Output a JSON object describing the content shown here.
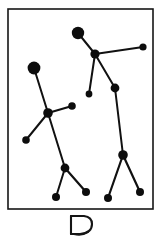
{
  "figure": {
    "kind": "constellation-star-chart",
    "panel_label": "B",
    "title": "",
    "background_color": "#ffffff",
    "ink_color": "#0d0d0d",
    "frame": {
      "x": 8,
      "y": 9,
      "width": 145,
      "height": 200,
      "stroke_color": "#161616",
      "stroke_width": 1.6
    },
    "caption": "B"
  },
  "chart_data": {
    "type": "scatter",
    "title": "",
    "subtitle": "",
    "xlabel": "",
    "ylabel": "",
    "xlim": [
      8,
      153
    ],
    "ylim": [
      9,
      209
    ],
    "grid": false,
    "legend": "none",
    "annotations": [
      "B"
    ],
    "stars": [
      {
        "id": "s1",
        "x": 78,
        "y": 33,
        "r": 6.2,
        "magnitude": "bright"
      },
      {
        "id": "s2",
        "x": 95,
        "y": 54,
        "r": 4.6,
        "magnitude": "medium"
      },
      {
        "id": "s3",
        "x": 143,
        "y": 47,
        "r": 3.6,
        "magnitude": "faint"
      },
      {
        "id": "s4",
        "x": 34,
        "y": 68,
        "r": 6.4,
        "magnitude": "bright"
      },
      {
        "id": "s5",
        "x": 89,
        "y": 94,
        "r": 3.4,
        "magnitude": "faint"
      },
      {
        "id": "s6",
        "x": 115,
        "y": 88,
        "r": 4.4,
        "magnitude": "medium"
      },
      {
        "id": "s7",
        "x": 72,
        "y": 106,
        "r": 3.8,
        "magnitude": "faint"
      },
      {
        "id": "s8",
        "x": 48,
        "y": 113,
        "r": 4.8,
        "magnitude": "medium"
      },
      {
        "id": "s9",
        "x": 26,
        "y": 140,
        "r": 3.8,
        "magnitude": "faint"
      },
      {
        "id": "s10",
        "x": 123,
        "y": 155,
        "r": 4.8,
        "magnitude": "medium"
      },
      {
        "id": "s11",
        "x": 65,
        "y": 168,
        "r": 4.4,
        "magnitude": "medium"
      },
      {
        "id": "s12",
        "x": 56,
        "y": 197,
        "r": 4.0,
        "magnitude": "faint"
      },
      {
        "id": "s13",
        "x": 86,
        "y": 192,
        "r": 4.0,
        "magnitude": "faint"
      },
      {
        "id": "s14",
        "x": 108,
        "y": 198,
        "r": 4.0,
        "magnitude": "faint"
      },
      {
        "id": "s15",
        "x": 140,
        "y": 192,
        "r": 4.0,
        "magnitude": "faint"
      }
    ],
    "lines": [
      {
        "from": "s1",
        "to": "s2",
        "width": 2.0
      },
      {
        "from": "s2",
        "to": "s3",
        "width": 2.0
      },
      {
        "from": "s2",
        "to": "s5",
        "width": 2.0
      },
      {
        "from": "s2",
        "to": "s6",
        "width": 2.0
      },
      {
        "from": "s6",
        "to": "s10",
        "width": 2.0
      },
      {
        "from": "s4",
        "to": "s8",
        "width": 2.0
      },
      {
        "from": "s8",
        "to": "s7",
        "width": 2.2
      },
      {
        "from": "s8",
        "to": "s9",
        "width": 2.0
      },
      {
        "from": "s8",
        "to": "s11",
        "width": 2.0
      },
      {
        "from": "s11",
        "to": "s12",
        "width": 2.0
      },
      {
        "from": "s11",
        "to": "s13",
        "width": 2.2
      },
      {
        "from": "s10",
        "to": "s14",
        "width": 2.2
      },
      {
        "from": "s10",
        "to": "s15",
        "width": 2.2
      }
    ]
  }
}
